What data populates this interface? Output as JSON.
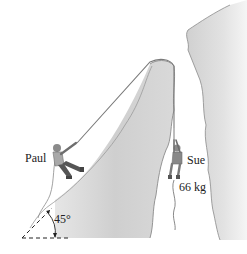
{
  "figure": {
    "labels": {
      "paul": "Paul",
      "sue": "Sue",
      "sue_mass": "66 kg",
      "angle": "45°"
    },
    "colors": {
      "background": "#ffffff",
      "rock_fill": "#d4d4d4",
      "rock_edge": "#8a8a8a",
      "rope": "#7a7a7a",
      "text": "#222222",
      "climber": "#6e6e6e"
    }
  }
}
